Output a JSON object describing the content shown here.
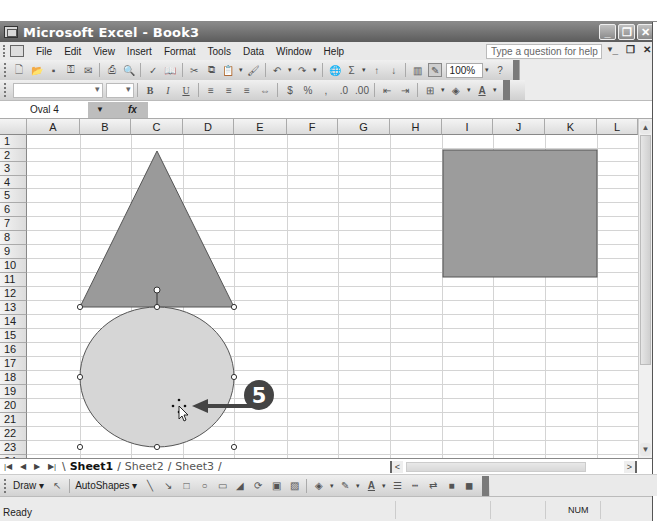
{
  "window": {
    "title": "Microsoft Excel - Book3",
    "buttons": [
      "minimize",
      "restore",
      "close"
    ]
  },
  "menubar": {
    "items": [
      {
        "label": "File",
        "accel": "F"
      },
      {
        "label": "Edit",
        "accel": "E"
      },
      {
        "label": "View",
        "accel": "V"
      },
      {
        "label": "Insert",
        "accel": "I"
      },
      {
        "label": "Format",
        "accel": "o"
      },
      {
        "label": "Tools",
        "accel": "T"
      },
      {
        "label": "Data",
        "accel": "D"
      },
      {
        "label": "Window",
        "accel": "W"
      },
      {
        "label": "Help",
        "accel": "H"
      }
    ],
    "help_placeholder": "Type a question for help"
  },
  "standard_toolbar": {
    "icons": [
      "new-icon",
      "open-icon",
      "save-icon",
      "permission-icon",
      "email-icon",
      "print-icon",
      "print-preview-icon",
      "spelling-icon",
      "research-icon",
      "cut-icon",
      "copy-icon",
      "paste-icon",
      "format-painter-icon",
      "undo-icon",
      "redo-icon",
      "hyperlink-icon",
      "autosum-icon",
      "sort-ascending-icon",
      "sort-descending-icon",
      "chart-wizard-icon",
      "drawing-icon"
    ],
    "zoom": "100%"
  },
  "formatting_toolbar": {
    "font": "",
    "size": "",
    "buttons": [
      "B",
      "I",
      "U"
    ],
    "icons": [
      "align-left-icon",
      "center-icon",
      "align-right-icon",
      "merge-center-icon",
      "currency-icon",
      "percent-icon",
      "comma-icon",
      "increase-decimal-icon",
      "decrease-decimal-icon",
      "decrease-indent-icon",
      "increase-indent-icon",
      "borders-icon",
      "fill-color-icon",
      "font-color-icon"
    ]
  },
  "formula_bar": {
    "name_box": "Oval 4",
    "fx_label": "fx",
    "content": ""
  },
  "grid": {
    "columns": [
      "A",
      "B",
      "C",
      "D",
      "E",
      "F",
      "G",
      "H",
      "I",
      "J",
      "K",
      "L"
    ],
    "rows": [
      "1",
      "2",
      "3",
      "4",
      "5",
      "6",
      "7",
      "8",
      "9",
      "10",
      "11",
      "12",
      "13",
      "14",
      "15",
      "16",
      "17",
      "18",
      "19",
      "20",
      "21",
      "22",
      "23",
      "24"
    ]
  },
  "shapes": [
    {
      "type": "triangle",
      "fill": "#9a9a9a",
      "stroke": "#555555"
    },
    {
      "type": "oval",
      "name": "Oval 4",
      "fill": "#d6d6d6",
      "stroke": "#555555",
      "selected": true
    },
    {
      "type": "rectangle",
      "fill": "#9c9c9c",
      "stroke": "#555555"
    }
  ],
  "callout": {
    "number": "5",
    "color": "#444444"
  },
  "sheet_tabs": [
    {
      "label": "Sheet1",
      "active": true
    },
    {
      "label": "Sheet2",
      "active": false
    },
    {
      "label": "Sheet3",
      "active": false
    }
  ],
  "drawing_toolbar": {
    "draw_label": "Draw",
    "autoshapes_label": "AutoShapes",
    "icons": [
      "select-objects-icon",
      "line-icon",
      "arrow-icon",
      "rectangle-icon",
      "oval-icon",
      "text-box-icon",
      "wordart-icon",
      "diagram-icon",
      "clip-art-icon",
      "picture-icon",
      "fill-color-icon",
      "line-color-icon",
      "font-color-icon",
      "line-style-icon",
      "dash-style-icon",
      "arrow-style-icon",
      "shadow-icon",
      "3d-icon"
    ]
  },
  "status_bar": {
    "status": "Ready",
    "num": "NUM"
  }
}
